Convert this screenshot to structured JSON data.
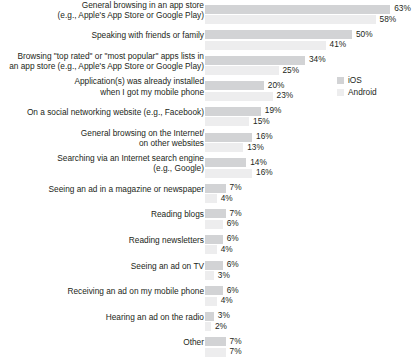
{
  "chart_data": {
    "type": "bar",
    "orientation": "horizontal",
    "title": "",
    "subtitle": "",
    "xlabel": "",
    "ylabel": "",
    "grid": false,
    "xlim": [
      0,
      70
    ],
    "value_suffix": "%",
    "legend_position": "right-upper",
    "categories": [
      "General browsing in an app store\n(e.g., Apple's App Store or Google Play)",
      "Speaking with friends or family",
      "Browsing \"top rated\" or \"most popular\" apps lists in\nan app store (e.g., Apple's App Store or Google Play)",
      "Application(s) was already installed\nwhen I got my mobile phone",
      "On a social networking website (e.g., Facebook)",
      "General browsing on the Internet/\non other websites",
      "Searching via an Internet search engine\n(e.g., Google)",
      "Seeing an ad in a magazine or newspaper",
      "Reading blogs",
      "Reading newsletters",
      "Seeing an ad on TV",
      "Receiving an ad on my mobile phone",
      "Hearing an ad on the radio",
      "Other"
    ],
    "series": [
      {
        "name": "iOS",
        "color": "#d2d3d5",
        "values": [
          63,
          50,
          34,
          20,
          19,
          16,
          14,
          7,
          7,
          6,
          6,
          6,
          3,
          7
        ],
        "labels": [
          "63%",
          "50%",
          "34%",
          "20%",
          "19%",
          "16%",
          "14%",
          "7%",
          "7%",
          "6%",
          "6%",
          "6%",
          "3%",
          "7%"
        ]
      },
      {
        "name": "Android",
        "color": "#ededee",
        "values": [
          58,
          41,
          25,
          23,
          15,
          13,
          16,
          4,
          6,
          4,
          3,
          4,
          2,
          7
        ],
        "labels": [
          "58%",
          "41%",
          "25%",
          "23%",
          "15%",
          "13%",
          "16%",
          "4%",
          "6%",
          "4%",
          "3%",
          "4%",
          "2%",
          "7%"
        ]
      }
    ]
  },
  "legend": {
    "items": [
      {
        "label": "iOS"
      },
      {
        "label": "Android"
      }
    ]
  }
}
